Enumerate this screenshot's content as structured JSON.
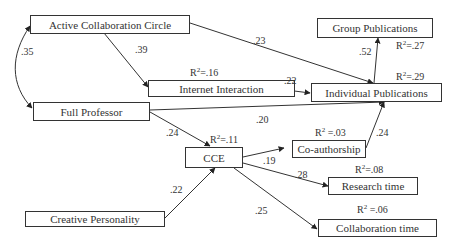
{
  "diagram": {
    "type": "path-model",
    "nodes": {
      "acc": {
        "label": "Active Collaboration Circle"
      },
      "gp": {
        "label": "Group Publications"
      },
      "ii": {
        "label": "Internet Interaction"
      },
      "ip": {
        "label": "Individual Publications"
      },
      "fp": {
        "label": "Full Professor"
      },
      "cce": {
        "label": "CCE"
      },
      "co": {
        "label": "Co-authorship"
      },
      "rt": {
        "label": "Research time"
      },
      "ct": {
        "label": "Collaboration time"
      },
      "cp": {
        "label": "Creative Personality"
      }
    },
    "r2": {
      "ii": {
        "prefix": "R",
        "sup": "2",
        "value": "=.16"
      },
      "gp": {
        "prefix": "R",
        "sup": "2",
        "value": "=.27"
      },
      "ip": {
        "prefix": "R",
        "sup": "2",
        "value": "=.29"
      },
      "cce": {
        "prefix": "R",
        "sup": "2",
        "value": "=.11"
      },
      "co": {
        "prefix": "R",
        "sup": "2",
        "value": " =.03"
      },
      "rt": {
        "prefix": "R",
        "sup": "2",
        "value": "=.08"
      },
      "ct": {
        "prefix": "R",
        "sup": "2",
        "value": " =.06"
      }
    },
    "paths": [
      {
        "from": "Active Collaboration Circle",
        "to": "Full Professor",
        "coef": ".35",
        "kind": "correlation"
      },
      {
        "from": "Active Collaboration Circle",
        "to": "Internet Interaction",
        "coef": ".39"
      },
      {
        "from": "Active Collaboration Circle",
        "to": "Individual Publications",
        "coef": ".23"
      },
      {
        "from": "Individual Publications",
        "to": "Group Publications",
        "coef": ".52"
      },
      {
        "from": "Internet Interaction",
        "to": "Individual Publications",
        "coef": ".22"
      },
      {
        "from": "Full Professor",
        "to": "Individual Publications",
        "coef": ".20"
      },
      {
        "from": "Full Professor",
        "to": "CCE",
        "coef": ".24"
      },
      {
        "from": "Co-authorship",
        "to": "Individual Publications",
        "coef": ".24"
      },
      {
        "from": "CCE",
        "to": "Co-authorship",
        "coef": ".19"
      },
      {
        "from": "CCE",
        "to": "Research time",
        "coef": ".28"
      },
      {
        "from": "CCE",
        "to": "Collaboration time",
        "coef": ".25"
      },
      {
        "from": "Creative Personality",
        "to": "CCE",
        "coef": ".22"
      }
    ]
  }
}
